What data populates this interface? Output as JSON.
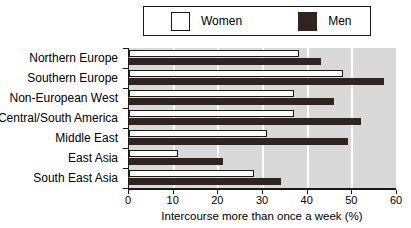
{
  "legend": {
    "entries": [
      {
        "label": "Women",
        "swatch": "women-swatch",
        "color": "#ffffff"
      },
      {
        "label": "Men",
        "swatch": "men-swatch",
        "color": "#2e2520"
      }
    ]
  },
  "chart_data": {
    "type": "bar",
    "orientation": "horizontal",
    "title": "",
    "xlabel": "Intercourse more than once a week (%)",
    "ylabel": "",
    "xlim": [
      0,
      60
    ],
    "xticks": [
      0,
      10,
      20,
      30,
      40,
      50,
      60
    ],
    "xticklabels": [
      "0",
      "10",
      "20",
      "30",
      "40",
      "50",
      "60"
    ],
    "grid": "vertical-white-gridlines",
    "legend_position": "top-center",
    "categories": [
      "Northern Europe",
      "Southern Europe",
      "Non-European West",
      "Central/South America",
      "Middle East",
      "East Asia",
      "South East Asia"
    ],
    "series": [
      {
        "name": "Women",
        "color": "#ffffff",
        "values": [
          38,
          48,
          37,
          37,
          31,
          11,
          28
        ]
      },
      {
        "name": "Men",
        "color": "#2e2520",
        "values": [
          43,
          57,
          46,
          52,
          49,
          21,
          34
        ]
      }
    ]
  }
}
